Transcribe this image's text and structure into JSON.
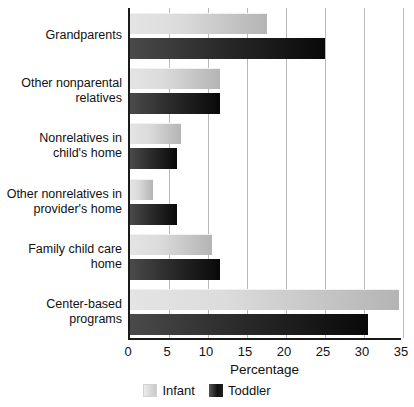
{
  "chart_data": {
    "type": "bar",
    "orientation": "horizontal",
    "title": "",
    "xlabel": "Percentage",
    "ylabel": "",
    "xlim": [
      0,
      35
    ],
    "xticks": [
      0,
      5,
      10,
      15,
      20,
      25,
      30,
      35
    ],
    "grid": true,
    "legend_position": "bottom",
    "categories": [
      "Grandparents",
      "Other nonparental\nrelatives",
      "Nonrelatives in\nchild's home",
      "Other nonrelatives in\nprovider's home",
      "Family child care\nhome",
      "Center-based\nprograms"
    ],
    "series": [
      {
        "name": "Infant",
        "color": "#d2d2d2",
        "values": [
          17.5,
          11.5,
          6.5,
          3.0,
          10.5,
          34.5
        ]
      },
      {
        "name": "Toddler",
        "color": "#101010",
        "values": [
          25.0,
          11.5,
          6.0,
          6.0,
          11.5,
          30.5
        ]
      }
    ]
  },
  "axis": {
    "x_title": "Percentage",
    "tick_labels": [
      "0",
      "5",
      "10",
      "15",
      "20",
      "25",
      "30",
      "35"
    ]
  },
  "legend": {
    "entries": [
      {
        "label": "Infant"
      },
      {
        "label": "Toddler"
      }
    ]
  }
}
